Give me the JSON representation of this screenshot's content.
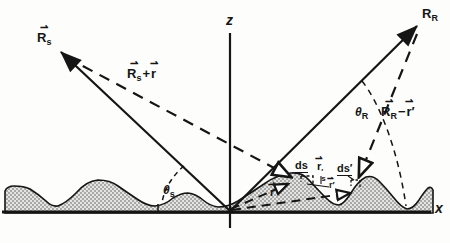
{
  "axis_labels": {
    "z": "z",
    "x": "x"
  },
  "labels": {
    "source_point": {
      "arrow": "⇀",
      "base": "R",
      "sub": "s"
    },
    "receiver_point": {
      "base": "R",
      "sub": "R"
    },
    "incident_vector_sum": {
      "arrow_a": "⇀",
      "base_a": "R",
      "sub_a": "s",
      "operator": "+",
      "arrow_b": "⇀",
      "base_b": "r"
    },
    "receiver_vector_diff": {
      "arrow_a": "⇀",
      "base_a": "R",
      "sub_a": "R",
      "operator": "−",
      "arrow_b": "⇀",
      "base_b": "r",
      "prime_b": "′"
    },
    "incidence_angle": {
      "base": "θ",
      "sub": "s"
    },
    "scattering_angle": {
      "base": "θ",
      "sub": "R"
    },
    "surface_element": "ds",
    "surface_element_prime": {
      "base": "ds",
      "prime": "′"
    },
    "position_vector": {
      "arrow": "⇀",
      "base": "r"
    },
    "position_vector_prime": {
      "arrow": "⇀",
      "base": "r",
      "prime": "′"
    },
    "relative_vector": {
      "arrow": "⇀",
      "base": "r",
      "prime": "′",
      "sub": "s"
    }
  },
  "colors": {
    "ink": "#151515",
    "paper": "#fdfdfc",
    "surface_fill_base": "#e4e4e2",
    "surface_fill_dot": "#a9a9a7"
  }
}
